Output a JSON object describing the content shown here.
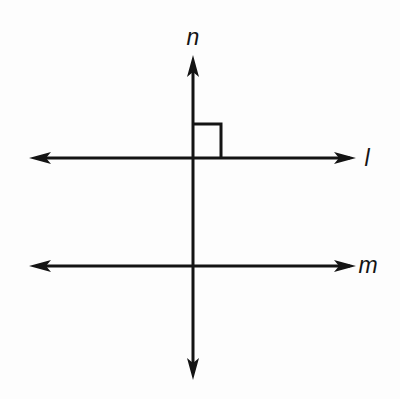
{
  "figure": {
    "background_color": "#fdfdfd",
    "stroke_color": "#141414",
    "stroke_width": 3,
    "canvas": {
      "width": 400,
      "height": 399
    }
  },
  "labels": {
    "vertical_line": "n",
    "upper_horizontal_line": "l",
    "lower_horizontal_line": "m"
  },
  "geometry": {
    "vertical_line": {
      "name": "n",
      "x": 193,
      "y_top": 57,
      "y_bottom": 378,
      "arrowheads": [
        "top",
        "bottom"
      ]
    },
    "upper_horizontal_line": {
      "name": "l",
      "y": 158,
      "x_left": 30,
      "x_right": 355,
      "arrowheads": [
        "left",
        "right"
      ]
    },
    "lower_horizontal_line": {
      "name": "m",
      "y": 266,
      "x_left": 30,
      "x_right": 355,
      "arrowheads": [
        "left",
        "right"
      ]
    },
    "right_angle_marker": {
      "quadrant": "upper-right",
      "x": 194,
      "y": 124,
      "size": 28,
      "at_intersection": "n and l"
    },
    "intersections": [
      {
        "lines": "n and l",
        "x": 193,
        "y": 158,
        "angle_degrees": 90
      },
      {
        "lines": "n and m",
        "x": 193,
        "y": 266,
        "angle_degrees": 90
      }
    ]
  },
  "label_positions": {
    "n": {
      "x": 193,
      "y": 45
    },
    "l": {
      "x": 367,
      "y": 166
    },
    "m": {
      "x": 368,
      "y": 273
    }
  }
}
